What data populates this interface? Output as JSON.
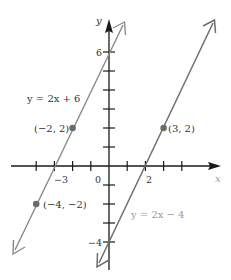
{
  "figure": {
    "type": "coordinate-plane",
    "axes": {
      "x_label": "x",
      "y_label": "y",
      "origin_label": "0",
      "x_tick_labels": [
        {
          "value": -3,
          "text": "−3"
        },
        {
          "value": 2,
          "text": "2"
        }
      ],
      "y_tick_labels": [
        {
          "value": 6,
          "text": "6"
        },
        {
          "value": -4,
          "text": "−4"
        }
      ],
      "x_ticks": [
        -4,
        -3,
        -2,
        -1,
        1,
        2,
        3,
        4
      ],
      "y_ticks": [
        -4,
        -3,
        -2,
        -1,
        1,
        2,
        3,
        4,
        5,
        6
      ]
    },
    "lines": [
      {
        "equation_label": "y = 2x + 6",
        "slope": 2,
        "intercept": 6,
        "color": "#8a8a8a"
      },
      {
        "equation_label": "y = 2x − 4",
        "slope": 2,
        "intercept": -4,
        "color": "#6e6e6e"
      }
    ],
    "points": [
      {
        "label": "(−2, 2)",
        "x": -2,
        "y": 2
      },
      {
        "label": "(−4, −2)",
        "x": -4,
        "y": -2
      },
      {
        "label": "(3, 2)",
        "x": 3,
        "y": 2
      }
    ],
    "colors": {
      "axis": "#1a1a1a",
      "point": "#6b6b6b",
      "line_upper": "#8a8a8a",
      "line_lower": "#6e6e6e"
    }
  }
}
